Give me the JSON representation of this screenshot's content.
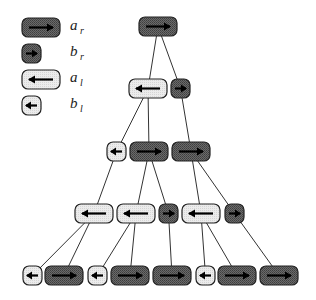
{
  "legend": {
    "items": [
      {
        "key": "a_r",
        "symbol": "a",
        "sub": "r",
        "type": "ar"
      },
      {
        "key": "b_r",
        "symbol": "b",
        "sub": "r",
        "type": "br"
      },
      {
        "key": "a_l",
        "symbol": "a",
        "sub": "l",
        "type": "al"
      },
      {
        "key": "b_l",
        "symbol": "b",
        "sub": "l",
        "type": "bl"
      }
    ]
  },
  "colors": {
    "dark_fill": "#5a5a5a",
    "light_fill": "#e4e4e4",
    "stroke": "#222222"
  },
  "tree": {
    "nodes": [
      {
        "id": "n0",
        "type": "ar",
        "x": 139,
        "y": 17
      },
      {
        "id": "n1",
        "type": "al",
        "x": 129,
        "y": 79
      },
      {
        "id": "n2",
        "type": "br",
        "x": 171,
        "y": 79
      },
      {
        "id": "n3",
        "type": "bl",
        "x": 107,
        "y": 142
      },
      {
        "id": "n4",
        "type": "ar",
        "x": 130,
        "y": 142
      },
      {
        "id": "n5",
        "type": "ar",
        "x": 172,
        "y": 142
      },
      {
        "id": "n6",
        "type": "al",
        "x": 75,
        "y": 204
      },
      {
        "id": "n7",
        "type": "al",
        "x": 117,
        "y": 204
      },
      {
        "id": "n8",
        "type": "br",
        "x": 159,
        "y": 204
      },
      {
        "id": "n9",
        "type": "al",
        "x": 182,
        "y": 204
      },
      {
        "id": "n10",
        "type": "br",
        "x": 225,
        "y": 204
      },
      {
        "id": "n11",
        "type": "bl",
        "x": 23,
        "y": 266
      },
      {
        "id": "n12",
        "type": "ar",
        "x": 45,
        "y": 266
      },
      {
        "id": "n13",
        "type": "bl",
        "x": 88,
        "y": 266
      },
      {
        "id": "n14",
        "type": "ar",
        "x": 111,
        "y": 266
      },
      {
        "id": "n15",
        "type": "ar",
        "x": 153,
        "y": 266
      },
      {
        "id": "n16",
        "type": "bl",
        "x": 196,
        "y": 266
      },
      {
        "id": "n17",
        "type": "ar",
        "x": 218,
        "y": 266
      },
      {
        "id": "n18",
        "type": "ar",
        "x": 260,
        "y": 266
      }
    ],
    "edges": [
      [
        "n0",
        "n1"
      ],
      [
        "n0",
        "n2"
      ],
      [
        "n1",
        "n3"
      ],
      [
        "n1",
        "n4"
      ],
      [
        "n2",
        "n5"
      ],
      [
        "n3",
        "n6"
      ],
      [
        "n4",
        "n7"
      ],
      [
        "n4",
        "n8"
      ],
      [
        "n5",
        "n9"
      ],
      [
        "n5",
        "n10"
      ],
      [
        "n6",
        "n11"
      ],
      [
        "n6",
        "n12"
      ],
      [
        "n7",
        "n13"
      ],
      [
        "n7",
        "n14"
      ],
      [
        "n8",
        "n15"
      ],
      [
        "n9",
        "n16"
      ],
      [
        "n9",
        "n17"
      ],
      [
        "n10",
        "n18"
      ]
    ]
  }
}
